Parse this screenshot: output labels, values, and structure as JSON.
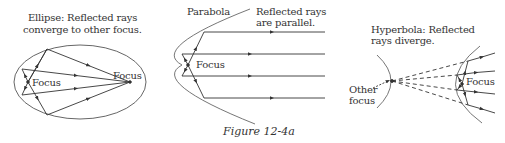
{
  "figure": {
    "caption": "Figure 12-4a",
    "colors": {
      "ink": "#333333",
      "curve": "#666666",
      "background": "#ffffff"
    }
  },
  "ellipse_panel": {
    "title_line1": "Ellipse: Reflected rays",
    "title_line2": "converge to other focus.",
    "focus_left_label": "Focus",
    "focus_right_label": "Focus"
  },
  "parabola_panel": {
    "curve_label": "Parabola",
    "title_line1": "Reflected rays",
    "title_line2": "are parallel.",
    "focus_label": "Focus"
  },
  "hyperbola_panel": {
    "title_line1": "Hyperbola: Reflected",
    "title_line2": "rays diverge.",
    "other_focus_line1": "Other",
    "other_focus_line2": "focus",
    "focus_label": "Focus"
  }
}
